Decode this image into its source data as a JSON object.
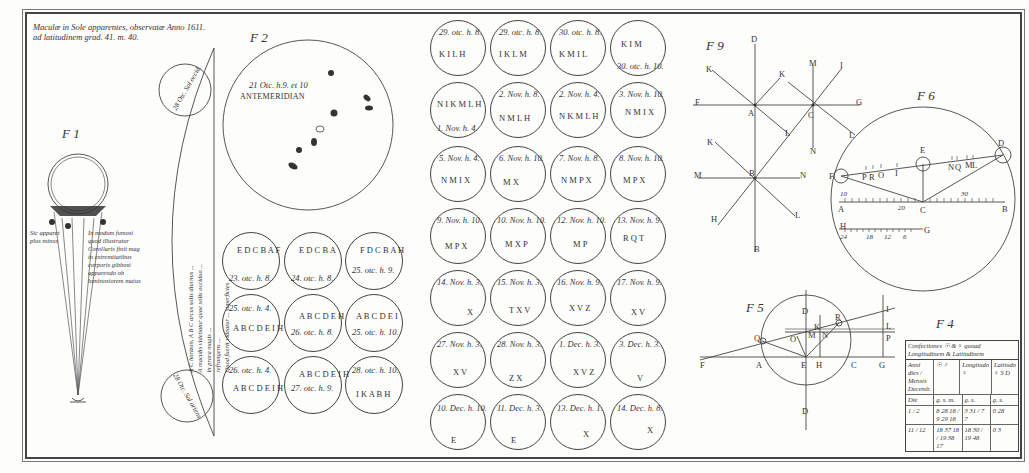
{
  "plate": {
    "title_line1": "Maculæ in Sole apparentes, observatæ Anno 1611.",
    "title_line2": "ad latitudinem grad. 41. m. 40."
  },
  "fig1": {
    "label": "F 1",
    "points": [
      "A",
      "F",
      "B",
      "E",
      "K",
      "C",
      "G",
      "L",
      "D",
      "M",
      "B"
    ],
    "caption_left": [
      "Sic apparet",
      "plus minus"
    ],
    "caption_right": [
      "In modum fumosi",
      "quod illustratur",
      "Corollaris finit mag",
      "in extremitatibus",
      "corporis gibbosi",
      "apparendo ob",
      "luminosiorem maius"
    ]
  },
  "fig_strip": {
    "top_circle_label": "28 Otc. Sol occid.",
    "bottom_circle_label": "28 Otc. Sol oriens",
    "vertical_text": [
      "A C horizon, A B C arcus solis diurnus ...",
      "A maculis videbatur quae solis occiduo ...",
      "in prora magis ...",
      "refrangens ...",
      "Quod fuerit videatur ... superficies"
    ],
    "letters": [
      "C",
      "B",
      "A"
    ]
  },
  "fig2": {
    "label": "F 2",
    "date": "21 Otc. h.9. et 10",
    "heading": "ANTEMERIDIAN",
    "spot_labels": [
      "A",
      "B",
      "C",
      "D",
      "E",
      "F",
      "G"
    ]
  },
  "small_circles_left": [
    {
      "label": "23. otc. h. 8.",
      "spots": "E D C B A F"
    },
    {
      "label": "24. otc. h. 8.",
      "spots": "E D C B A"
    },
    {
      "label": "25. otc. h. 9.",
      "spots": "F D C B A H"
    },
    {
      "label": "25. otc. h. 4.",
      "spots": "A B C D E I H"
    },
    {
      "label": "26. otc. h. 8.",
      "spots": "A B C D E H"
    },
    {
      "label": "25. otc. h. 10.",
      "spots": "A B C D E I"
    },
    {
      "label": "26. otc. h. 4.",
      "spots": "A B C D E I H"
    },
    {
      "label": "27. otc. h. 9.",
      "spots": "A B C D E I H"
    },
    {
      "label": "28. otc. h. 10.",
      "spots": "I K A B H"
    }
  ],
  "small_circles_grid": [
    {
      "label": "29. otc. h. 8.",
      "spots": "K I L H"
    },
    {
      "label": "29. otc. h. 8.",
      "spots": "I K L M"
    },
    {
      "label": "30. otc. h. 8.",
      "spots": "K M I L"
    },
    {
      "label": "30. otc. h. 10.",
      "spots": "K I M"
    },
    {
      "label": "1. Nov. h. 4.",
      "spots": "N I K M L H"
    },
    {
      "label": "2. Nov. h. 8.",
      "spots": "N M L H"
    },
    {
      "label": "2. Nov. h. 4.",
      "spots": "N K M L H"
    },
    {
      "label": "3. Nov. h. 10.",
      "spots": "N M I X"
    },
    {
      "label": "5. Nov. h. 4.",
      "spots": "N M I X"
    },
    {
      "label": "6. Nov. h. 10.",
      "spots": "M X"
    },
    {
      "label": "7. Nov. h. 8.",
      "spots": "N M P X"
    },
    {
      "label": "8. Nov. h. 10.",
      "spots": "M P X"
    },
    {
      "label": "9. Nov. h. 10.",
      "spots": "M P X"
    },
    {
      "label": "10. Nov. h. 10.",
      "spots": "M X P"
    },
    {
      "label": "12. Nov. h. 10.",
      "spots": "M P"
    },
    {
      "label": "13. Nov. h. 9.",
      "spots": "R Q T"
    },
    {
      "label": "14. Nov. h. 3.",
      "spots": "X"
    },
    {
      "label": "15. Nov. h. 3.",
      "spots": "T X V"
    },
    {
      "label": "16. Nov. h. 9.",
      "spots": "X V Z"
    },
    {
      "label": "17. Nov. h. 9.",
      "spots": "X V"
    },
    {
      "label": "27. Nov. h. 3.",
      "spots": "X V"
    },
    {
      "label": "28. Nov. h. 3.",
      "spots": "Z X"
    },
    {
      "label": "1. Dec. h. 3.",
      "spots": "X V Z"
    },
    {
      "label": "3. Dec. h. 3.",
      "spots": "V"
    },
    {
      "label": "10. Dec. h. 10.",
      "spots": "E"
    },
    {
      "label": "11. Dec. h. 3.",
      "spots": "E"
    },
    {
      "label": "13. Dec. h. 1.",
      "spots": "X"
    },
    {
      "label": "14. Dec. h. 8.",
      "spots": "X"
    }
  ],
  "fig9": {
    "label": "F 9",
    "points": [
      "D",
      "K",
      "K",
      "M",
      "I",
      "F",
      "A",
      "C",
      "G",
      "L",
      "L",
      "N",
      "K",
      "B",
      "M",
      "N",
      "H",
      "L",
      "B"
    ]
  },
  "fig6": {
    "label": "F 6",
    "points": [
      "E",
      "D",
      "F",
      "P",
      "R",
      "O",
      "I",
      "N",
      "Q",
      "M",
      "L",
      "A",
      "C",
      "B",
      "H",
      "G"
    ],
    "scale_numbers": [
      "30",
      "20",
      "10",
      "24",
      "18",
      "12",
      "6"
    ]
  },
  "fig5": {
    "label": "F 5",
    "points": [
      "D",
      "R",
      "K",
      "M",
      "N",
      "O",
      "Q",
      "F",
      "A",
      "E",
      "H",
      "C",
      "G",
      "I",
      "L",
      "P",
      "D"
    ]
  },
  "fig4": {
    "label": "F 4",
    "header": "Confectiones ☉ & ♀ quoad Longitudinem & Latitudinem",
    "columns": [
      "Anni dies / Mensis Decemb.",
      "☉ ♂",
      "Longitudo ♀",
      "Latitudo ♀ S D"
    ],
    "rows": [
      [
        "Die",
        "g. s. m.",
        "g. s.",
        "g. s."
      ],
      [
        "1 / 2",
        "8 28 18 / 9 29 18",
        "3 31 / 7 7",
        "0 28"
      ],
      [
        "11 / 12",
        "18 37 18 / 19 38 17",
        "18 30 / 19 48",
        "0 3"
      ]
    ]
  }
}
